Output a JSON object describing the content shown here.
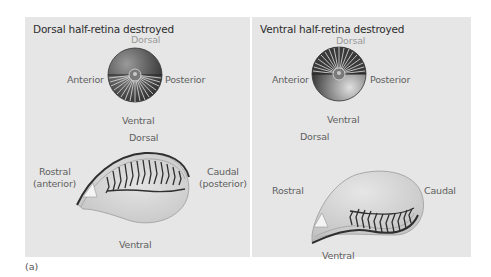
{
  "figure": {
    "caption": "(a)",
    "colors": {
      "panel_bg": "#e6e6e6",
      "eye_dark": "#3a3a3a",
      "eye_light": "#c8c8c8",
      "tectum_fill": "#d2d2d2",
      "fibers": "#2f2f2f",
      "label_text": "#5f5f5f"
    }
  },
  "panels": [
    {
      "title": "Dorsal half-retina destroyed",
      "eye": {
        "label_top": "Dorsal",
        "label_left": "Anterior",
        "label_right": "Posterior",
        "label_bottom": "Ventral",
        "intact_half": "ventral"
      },
      "tectum": {
        "label_top": "Dorsal",
        "label_left_line1": "Rostral",
        "label_left_line2": "(anterior)",
        "label_right_line1": "Caudal",
        "label_right_line2": "(posterior)",
        "label_bottom": "Ventral",
        "innervated_region": "dorsal"
      }
    },
    {
      "title": "Ventral half-retina destroyed",
      "eye": {
        "label_top": "Dorsal",
        "label_left": "Anterior",
        "label_right": "Posterior",
        "label_bottom": "Ventral",
        "intact_half": "dorsal"
      },
      "tectum": {
        "label_top": "Dorsal",
        "label_left": "Rostral",
        "label_right": "Caudal",
        "label_bottom": "Ventral",
        "innervated_region": "ventral"
      }
    }
  ]
}
